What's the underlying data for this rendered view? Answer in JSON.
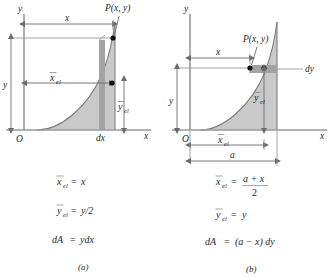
{
  "figure": {
    "colors": {
      "area_fill": "#c9c9c9",
      "strip_fill": "#a9a9a9",
      "axis": "#9a9a9a",
      "line": "#6b6b6b",
      "text": "#1f1f1f",
      "background": "#ffffff"
    }
  },
  "panel_a": {
    "caption": "(a)",
    "axis_y_label": "y",
    "axis_x_label": "x",
    "origin_label": "O",
    "point_label": "P(x, y)",
    "dim_x_label": "x",
    "dim_y_label": "y",
    "xel_label": "x",
    "xel_sub": "el",
    "yel_label": "y",
    "yel_sub": "el",
    "strip_label": "dx",
    "formulas": [
      {
        "lhs": "x",
        "lhs_sub": "el",
        "eq": "=",
        "rhs": "x"
      },
      {
        "lhs": "y",
        "lhs_sub": "el",
        "eq": "=",
        "rhs": "y/2"
      },
      {
        "lhs": "dA",
        "lhs_sub": "",
        "eq": "=",
        "rhs": "ydx"
      }
    ]
  },
  "panel_b": {
    "caption": "(b)",
    "axis_y_label": "y",
    "axis_x_label": "x",
    "origin_label": "O",
    "point_label": "P(x, y)",
    "dim_x_label": "x",
    "dim_y_label": "y",
    "dim_a_label": "a",
    "xel_label": "x",
    "xel_sub": "el",
    "yel_label": "y",
    "yel_sub": "el",
    "strip_label": "dy",
    "formulas": [
      {
        "lhs": "x",
        "lhs_sub": "el",
        "eq": "=",
        "rhs_num": "a + x",
        "rhs_den": "2"
      },
      {
        "lhs": "y",
        "lhs_sub": "el",
        "eq": "=",
        "rhs": "y"
      },
      {
        "lhs": "dA",
        "lhs_sub": "",
        "eq": "=",
        "rhs": "(a − x) dy"
      }
    ]
  }
}
